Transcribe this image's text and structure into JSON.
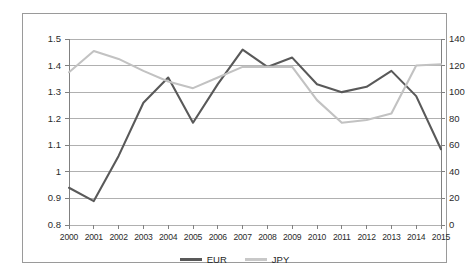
{
  "chart_data": {
    "type": "line",
    "title": "",
    "xlabel": "",
    "ylabel": "",
    "grid": true,
    "legend_position": "bottom",
    "categories": [
      "2000",
      "2001",
      "2002",
      "2003",
      "2004",
      "2005",
      "2006",
      "2007",
      "2008",
      "2009",
      "2010",
      "2011",
      "2012",
      "2013",
      "2014",
      "2015"
    ],
    "axes": {
      "left": {
        "label": "",
        "ylim": [
          0.8,
          1.5
        ],
        "ticks": [
          "0.8",
          "0.9",
          "1",
          "1.1",
          "1.2",
          "1.3",
          "1.4",
          "1.5"
        ],
        "tick_values": [
          0.8,
          0.9,
          1.0,
          1.1,
          1.2,
          1.3,
          1.4,
          1.5
        ]
      },
      "right": {
        "label": "",
        "ylim": [
          0,
          140
        ],
        "ticks": [
          "0",
          "20",
          "40",
          "60",
          "80",
          "100",
          "120",
          "140"
        ],
        "tick_values": [
          0,
          20,
          40,
          60,
          80,
          100,
          120,
          140
        ]
      }
    },
    "series": [
      {
        "name": "EUR",
        "axis": "left",
        "color": "#595959",
        "values": [
          0.94,
          0.89,
          1.06,
          1.26,
          1.355,
          1.185,
          1.33,
          1.46,
          1.395,
          1.43,
          1.33,
          1.3,
          1.32,
          1.38,
          1.285,
          1.085
        ]
      },
      {
        "name": "JPY",
        "axis": "right",
        "color": "#c8c8c8",
        "values": [
          115,
          131,
          125,
          116,
          108,
          103,
          111,
          119,
          119,
          119,
          94,
          77,
          79,
          84,
          120,
          121
        ]
      }
    ],
    "legend": [
      {
        "label": "EUR",
        "color": "#595959"
      },
      {
        "label": "JPY",
        "color": "#c8c8c8"
      }
    ]
  }
}
